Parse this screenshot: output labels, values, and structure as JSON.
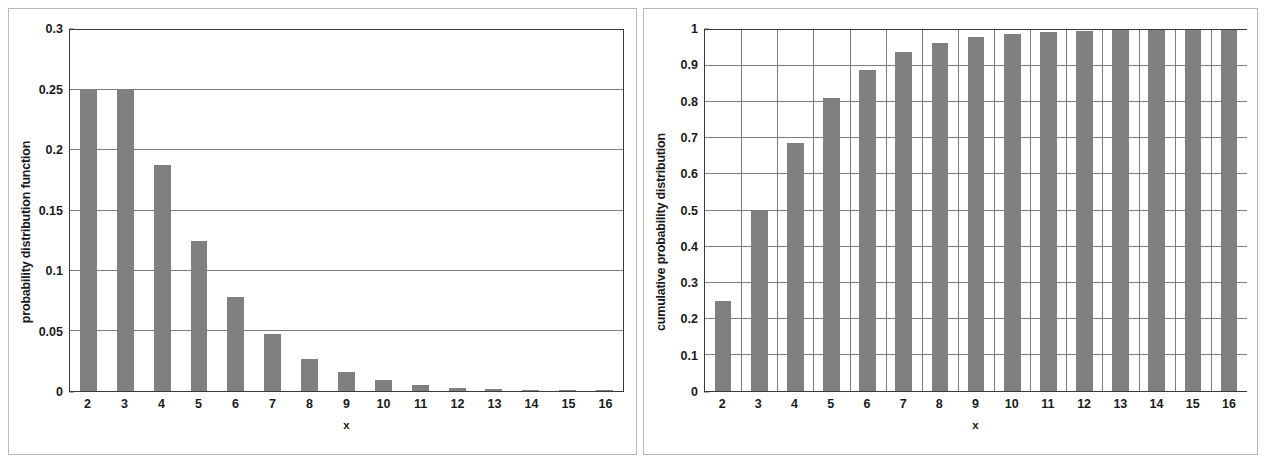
{
  "figure": {
    "background_color": "#ffffff",
    "bar_color": "#808080",
    "axis_color": "#3a3a3a",
    "grid_color": "#7d7d7d",
    "frame_color": "#b9b9b9"
  },
  "charts": [
    {
      "id": "pdf-chart",
      "ylabel": "probability distribution function",
      "xlabel": "x",
      "yticks": [
        "0",
        "0.05",
        "0.1",
        "0.15",
        "0.2",
        "0.25",
        "0.3"
      ],
      "xticks": [
        "2",
        "3",
        "4",
        "5",
        "6",
        "7",
        "8",
        "9",
        "10",
        "11",
        "12",
        "13",
        "14",
        "15",
        "16"
      ]
    },
    {
      "id": "cdf-chart",
      "ylabel": "cumulative probability distribution",
      "xlabel": "x",
      "yticks": [
        "0",
        "0.1",
        "0.2",
        "0.3",
        "0.4",
        "0.5",
        "0.6",
        "0.7",
        "0.8",
        "0.9",
        "1"
      ],
      "xticks": [
        "2",
        "3",
        "4",
        "5",
        "6",
        "7",
        "8",
        "9",
        "10",
        "11",
        "12",
        "13",
        "14",
        "15",
        "16"
      ]
    }
  ],
  "chart_data": [
    {
      "type": "bar",
      "title": "",
      "xlabel": "x",
      "ylabel": "probability distribution function",
      "categories": [
        2,
        3,
        4,
        5,
        6,
        7,
        8,
        9,
        10,
        11,
        12,
        13,
        14,
        15,
        16
      ],
      "values": [
        0.25,
        0.25,
        0.1875,
        0.125,
        0.078,
        0.047,
        0.027,
        0.016,
        0.0093,
        0.0052,
        0.0029,
        0.0016,
        0.0009,
        0.0005,
        0.0003
      ],
      "ylim": [
        0,
        0.3
      ],
      "ytick_values": [
        0,
        0.05,
        0.1,
        0.15,
        0.2,
        0.25,
        0.3
      ],
      "grid": "horizontal",
      "legend": "none",
      "bar_color": "#808080"
    },
    {
      "type": "bar",
      "title": "",
      "xlabel": "x",
      "ylabel": "cumulative probability distribution",
      "categories": [
        2,
        3,
        4,
        5,
        6,
        7,
        8,
        9,
        10,
        11,
        12,
        13,
        14,
        15,
        16
      ],
      "values": [
        0.25,
        0.5,
        0.6875,
        0.8125,
        0.89,
        0.938,
        0.965,
        0.981,
        0.99,
        0.995,
        0.998,
        0.9995,
        1.0,
        1.0,
        1.0
      ],
      "ylim": [
        0,
        1
      ],
      "ytick_values": [
        0,
        0.1,
        0.2,
        0.3,
        0.4,
        0.5,
        0.6,
        0.7,
        0.8,
        0.9,
        1
      ],
      "grid": "both",
      "legend": "none",
      "bar_color": "#808080"
    }
  ]
}
